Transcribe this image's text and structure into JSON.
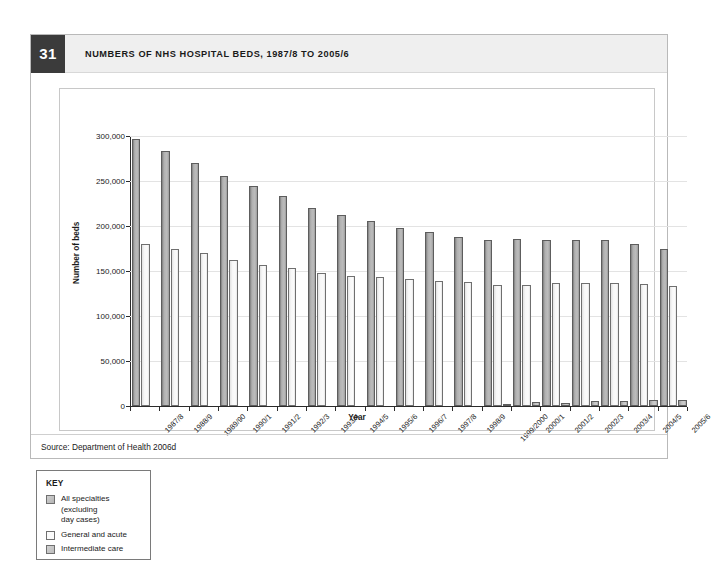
{
  "figure": {
    "number": "31",
    "title": "NUMBERS OF NHS HOSPITAL BEDS, 1987/8 TO 2005/6",
    "source": "Source: Department of Health 2006d"
  },
  "key": {
    "title": "KEY",
    "items": [
      {
        "label": "All specialties\n(excluding\nday cases)",
        "color": "#b8b8b8"
      },
      {
        "label": "General and acute",
        "color": "#fbfbfb"
      },
      {
        "label": "Intermediate care",
        "color": "#c6c6c6"
      }
    ]
  },
  "chart_data": {
    "type": "bar",
    "title": "NUMBERS OF NHS HOSPITAL BEDS, 1987/8 TO 2005/6",
    "xlabel": "Year",
    "ylabel": "Number of beds",
    "ylim": [
      0,
      300000
    ],
    "yticks": [
      0,
      50000,
      100000,
      150000,
      200000,
      250000,
      300000
    ],
    "ytick_labels": [
      "0",
      "50,000",
      "100,000",
      "150,000",
      "200,000",
      "250,000",
      "300,000"
    ],
    "grid": true,
    "legend_position": "below-left",
    "categories": [
      "1987/8",
      "1988/9",
      "1989/90",
      "1990/1",
      "1991/2",
      "1992/3",
      "1993/4",
      "1994/5",
      "1995/6",
      "1996/7",
      "1997/8",
      "1998/9",
      "1999/2000",
      "2000/1",
      "2001/2",
      "2002/3",
      "2003/4",
      "2004/5",
      "2005/6"
    ],
    "series": [
      {
        "name": "All specialties (excluding day cases)",
        "values": [
          297000,
          283000,
          270000,
          256000,
          245000,
          233000,
          220000,
          212000,
          206000,
          198000,
          193000,
          188000,
          185000,
          186000,
          184000,
          184000,
          184000,
          180000,
          174000
        ]
      },
      {
        "name": "General and acute",
        "values": [
          180000,
          174000,
          170000,
          162000,
          157000,
          153000,
          148000,
          145000,
          143000,
          141000,
          139000,
          138000,
          135000,
          134000,
          137000,
          137000,
          137000,
          136000,
          133000
        ]
      },
      {
        "name": "Intermediate care",
        "values": [
          0,
          0,
          0,
          0,
          0,
          0,
          0,
          0,
          0,
          0,
          0,
          0,
          1500,
          4000,
          3500,
          5500,
          6000,
          6500,
          7000
        ]
      }
    ]
  }
}
